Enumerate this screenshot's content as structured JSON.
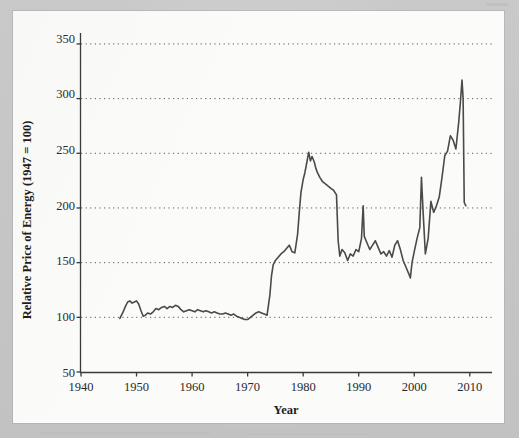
{
  "figure": {
    "background_color": "#c6c6c6",
    "panel_color": "#fbfbfa",
    "line_color": "#4a4a4a",
    "axis_color": "#3a3a3a",
    "grid_color": "#5a5a5a"
  },
  "chart_data": {
    "type": "line",
    "title": "",
    "xlabel": "Year",
    "ylabel": "Relative Price of Energy (1947 = 100)",
    "xlim": [
      1940,
      2014
    ],
    "ylim": [
      50,
      360
    ],
    "xticks": [
      1940,
      1950,
      1960,
      1970,
      1980,
      1990,
      2000,
      2010
    ],
    "xtick_labels": [
      "1940",
      "1950",
      "1960",
      "1970",
      "1980",
      "1990",
      "2000",
      "2010"
    ],
    "yticks": [
      50,
      100,
      150,
      200,
      250,
      300,
      350
    ],
    "ytick_labels": [
      "50",
      "100",
      "150",
      "200",
      "250",
      "300",
      "350"
    ],
    "grid": "horizontal-dotted",
    "gridlines_at": [
      100,
      150,
      200,
      250,
      300,
      350
    ],
    "legend": null,
    "series": [
      {
        "name": "Relative Price of Energy",
        "x": [
          1947.0,
          1947.5,
          1948.0,
          1948.4,
          1948.8,
          1949.2,
          1949.6,
          1950.0,
          1950.4,
          1950.8,
          1951.2,
          1951.6,
          1952.0,
          1952.5,
          1953.0,
          1953.5,
          1954.0,
          1954.5,
          1955.0,
          1955.5,
          1956.0,
          1956.5,
          1957.0,
          1957.5,
          1958.0,
          1958.5,
          1959.0,
          1959.5,
          1960.0,
          1960.5,
          1961.0,
          1961.5,
          1962.0,
          1962.5,
          1963.0,
          1963.5,
          1964.0,
          1964.5,
          1965.0,
          1965.5,
          1966.0,
          1966.5,
          1967.0,
          1967.5,
          1968.0,
          1968.5,
          1969.0,
          1969.5,
          1970.0,
          1970.5,
          1971.0,
          1971.5,
          1972.0,
          1972.5,
          1973.0,
          1973.5,
          1974.0,
          1974.3,
          1974.6,
          1975.0,
          1975.5,
          1976.0,
          1976.5,
          1977.0,
          1977.5,
          1978.0,
          1978.5,
          1979.0,
          1979.3,
          1979.6,
          1980.0,
          1980.3,
          1980.6,
          1981.0,
          1981.3,
          1981.6,
          1982.0,
          1982.3,
          1982.6,
          1983.0,
          1983.5,
          1984.0,
          1984.5,
          1985.0,
          1985.5,
          1986.0,
          1986.3,
          1986.6,
          1987.0,
          1987.5,
          1988.0,
          1988.5,
          1989.0,
          1989.5,
          1990.0,
          1990.5,
          1990.8,
          1991.0,
          1991.5,
          1992.0,
          1992.5,
          1993.0,
          1993.5,
          1994.0,
          1994.5,
          1995.0,
          1995.5,
          1996.0,
          1996.5,
          1997.0,
          1997.5,
          1998.0,
          1998.5,
          1999.0,
          1999.3,
          1999.6,
          2000.0,
          2000.5,
          2001.0,
          2001.3,
          2001.6,
          2002.0,
          2002.5,
          2003.0,
          2003.5,
          2004.0,
          2004.5,
          2005.0,
          2005.5,
          2006.0,
          2006.5,
          2007.0,
          2007.5,
          2008.0,
          2008.3,
          2008.6,
          2008.8,
          2009.0,
          2009.3
        ],
        "y": [
          99,
          104,
          110,
          114,
          115,
          113,
          114,
          115,
          112,
          106,
          101,
          102,
          104,
          103,
          105,
          108,
          107,
          109,
          110,
          108,
          110,
          109,
          111,
          110,
          107,
          105,
          106,
          107,
          106,
          105,
          107,
          106,
          105,
          106,
          105,
          104,
          105,
          104,
          103,
          103,
          104,
          103,
          102,
          103,
          101,
          100,
          99,
          98,
          98,
          100,
          102,
          104,
          105,
          104,
          103,
          102,
          120,
          138,
          148,
          152,
          155,
          158,
          160,
          163,
          166,
          160,
          159,
          176,
          196,
          214,
          226,
          232,
          240,
          251,
          243,
          247,
          242,
          236,
          232,
          228,
          224,
          222,
          220,
          218,
          216,
          212,
          170,
          156,
          162,
          159,
          152,
          158,
          156,
          162,
          160,
          172,
          202,
          174,
          168,
          162,
          166,
          170,
          164,
          158,
          160,
          156,
          161,
          155,
          166,
          170,
          162,
          152,
          146,
          140,
          136,
          150,
          160,
          172,
          182,
          228,
          196,
          158,
          172,
          206,
          196,
          202,
          210,
          228,
          248,
          252,
          266,
          262,
          254,
          278,
          296,
          317,
          300,
          205,
          202
        ],
        "color": "#4a4a4a",
        "linewidth": 1.6
      }
    ],
    "annotations": [],
    "data_note": "Monthly relative price index of energy, 1947-2009"
  },
  "axis": {
    "ylabel_text": "Relative Price of Energy (1947 = 100)",
    "xlabel_text": "Year"
  }
}
